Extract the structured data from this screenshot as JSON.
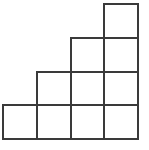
{
  "diagram": {
    "type": "staircase-grid",
    "line_color": "#3a3a3a",
    "background": "#ffffff",
    "grid": {
      "columns": 4,
      "rows": 4,
      "origin_x": 3,
      "origin_y": 4,
      "cell_size": 33.75,
      "line_width": 2
    },
    "rows": [
      {
        "row": 0,
        "cells": [
          3
        ]
      },
      {
        "row": 1,
        "cells": [
          2,
          3
        ]
      },
      {
        "row": 2,
        "cells": [
          1,
          2,
          3
        ]
      },
      {
        "row": 3,
        "cells": [
          0,
          1,
          2,
          3
        ]
      }
    ],
    "total_squares": 10
  }
}
